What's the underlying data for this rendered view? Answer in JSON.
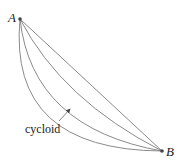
{
  "diagram": {
    "points": [
      {
        "label": "A",
        "x": 20,
        "y": 19
      },
      {
        "label": "B",
        "x": 162,
        "y": 151
      }
    ],
    "curves": [
      {
        "name": "straight-line",
        "d": "M20,19 L162,151"
      },
      {
        "name": "curve-1",
        "d": "M20,19 Q62,100 162,151"
      },
      {
        "name": "cycloid",
        "d": "M20,19 Q32,128 162,151"
      },
      {
        "name": "curve-3",
        "d": "M20,19 Q8,150 162,151"
      }
    ],
    "annotation": {
      "text": "cycloid",
      "arrow_from": [
        59,
        121
      ],
      "arrow_to": [
        71,
        108
      ]
    },
    "colors": {
      "curve": "#8a8a8a",
      "point": "#444444",
      "text": "#222222"
    }
  }
}
